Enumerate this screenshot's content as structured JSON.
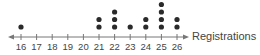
{
  "chart_data": {
    "type": "scatter",
    "subtype": "dot-plot",
    "title": "",
    "xlabel": "Registrations",
    "ylabel": "",
    "xlim": [
      16,
      26
    ],
    "x_ticks": [
      16,
      17,
      18,
      19,
      20,
      21,
      22,
      23,
      24,
      25,
      26
    ],
    "tick_labels": [
      "16",
      "17",
      "18",
      "19",
      "20",
      "21",
      "22",
      "23",
      "24",
      "25",
      "26"
    ],
    "x": [
      16,
      21,
      22,
      23,
      24,
      25,
      26
    ],
    "counts": [
      1,
      2,
      3,
      1,
      2,
      4,
      2
    ],
    "grid": false,
    "legend": "none",
    "colors": {
      "dot": "#2a2a2a",
      "axis": "#777777",
      "text": "#444444"
    }
  }
}
